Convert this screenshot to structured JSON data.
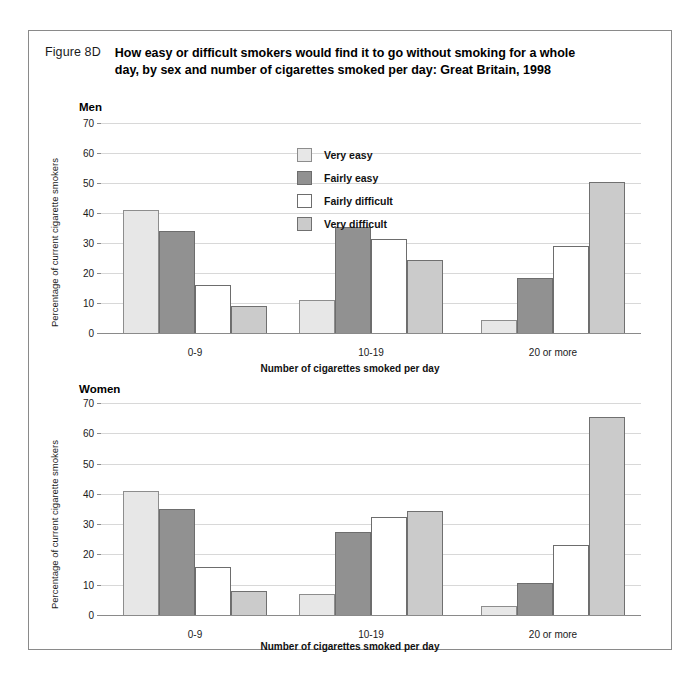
{
  "figure": {
    "number": "Figure 8D",
    "title": "How easy or difficult smokers would find it to go without smoking for a whole day, by sex and number of cigarettes smoked per day:  Great Britain, 1998"
  },
  "legend": {
    "items": [
      {
        "label": "Very easy",
        "key": "veryeasy",
        "color": "#e7e7e7"
      },
      {
        "label": "Fairly easy",
        "key": "fairlyeasy",
        "color": "#919191"
      },
      {
        "label": "Fairly difficult",
        "key": "fairlydiff",
        "color": "#ffffff"
      },
      {
        "label": "Very difficult",
        "key": "verydiff",
        "color": "#cbcbcb"
      }
    ]
  },
  "panels": {
    "men": {
      "heading": "Men"
    },
    "women": {
      "heading": "Women"
    }
  },
  "axes": {
    "ylabel": "Percentage of current cigarette smokers",
    "xlabel": "Number of cigarettes smoked per day",
    "yticks": [
      "70",
      "60",
      "50",
      "40",
      "30",
      "20",
      "10",
      "0"
    ],
    "xticks": [
      "0-9",
      "10-19",
      "20 or more"
    ]
  },
  "chart_data": [
    {
      "type": "bar",
      "title": "Men",
      "xlabel": "Number of cigarettes smoked per day",
      "ylabel": "Percentage of current cigarette smokers",
      "categories": [
        "0-9",
        "10-19",
        "20 or more"
      ],
      "ylim": [
        0,
        70
      ],
      "ytick_step": 10,
      "grid": true,
      "legend_position": "inside-top-left",
      "series": [
        {
          "name": "Very easy",
          "values": [
            41,
            11,
            4.5
          ]
        },
        {
          "name": "Fairly easy",
          "values": [
            34,
            35.5,
            18.5
          ]
        },
        {
          "name": "Fairly difficult",
          "values": [
            16,
            31.5,
            29
          ]
        },
        {
          "name": "Very difficult",
          "values": [
            9,
            24.5,
            50.5
          ]
        }
      ]
    },
    {
      "type": "bar",
      "title": "Women",
      "xlabel": "Number of cigarettes smoked per day",
      "ylabel": "Percentage of current cigarette smokers",
      "categories": [
        "0-9",
        "10-19",
        "20 or more"
      ],
      "ylim": [
        0,
        70
      ],
      "ytick_step": 10,
      "grid": true,
      "legend_position": "none",
      "series": [
        {
          "name": "Very easy",
          "values": [
            41,
            7,
            3
          ]
        },
        {
          "name": "Fairly easy",
          "values": [
            35,
            27.5,
            10.5
          ]
        },
        {
          "name": "Fairly difficult",
          "values": [
            16,
            32.5,
            23
          ]
        },
        {
          "name": "Very difficult",
          "values": [
            8,
            34.5,
            65.5
          ]
        }
      ]
    }
  ]
}
